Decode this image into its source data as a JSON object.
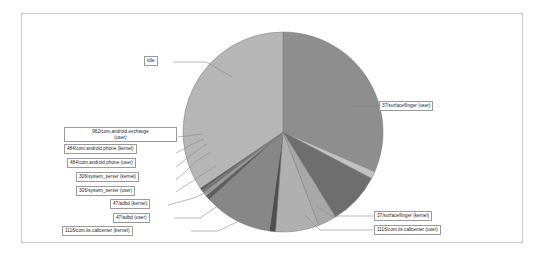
{
  "frame": {
    "border_color": "#c8c8c8",
    "background": "#ffffff"
  },
  "chart_data": {
    "type": "pie",
    "title": "",
    "xlabel": "",
    "ylabel": "",
    "legend_position": "callout-labels",
    "grid": false,
    "center": {
      "x": 283,
      "y": 132
    },
    "radius": 100,
    "start_angle_deg": -90,
    "direction": "clockwise",
    "categories": [
      "37/surfaceflinger (user)",
      "37/surfaceflinger (kernel)",
      "1116/com.iis.callcenter (user)",
      "1116/com.iis.callcenter (kernel)",
      "47/adbd (user)",
      "47/adbd (kernel)",
      "306/system_server (user)",
      "306/system_server (kernel)",
      "484/com.android.phone (user)",
      "484/com.android.phone (kernel)",
      "962/com.android.exchange (user)",
      "Idle"
    ],
    "values": [
      31.5,
      1.2,
      8.5,
      3.0,
      7.0,
      1.0,
      11.0,
      0.8,
      0.6,
      0.5,
      0.4,
      34.5
    ],
    "colors": [
      "#8e8e8e",
      "#c2c2c2",
      "#6e6e6e",
      "#a8a8a8",
      "#b0b0b0",
      "#4e4e4e",
      "#878787",
      "#5f5f5f",
      "#9c9c9c",
      "#747474",
      "#5a5a5a",
      "#b6b6b6"
    ],
    "slice_edge_color": "#7a7a7a"
  },
  "labels": {
    "idle": "Idle",
    "surfaceflinger_user": "37/surfaceflinger (user)",
    "surfaceflinger_kernel": "37/surfaceflinger (kernel)",
    "callcenter_user": "1116/com.iis.callcenter (user)",
    "callcenter_kernel": "1116/com.iis.callcenter (kernel)",
    "adbd_user": "47/adbd (user)",
    "adbd_kernel": "47/adbd (kernel)",
    "system_server_user": "306/system_server (user)",
    "system_server_kernel": "306/system_server (kernel)",
    "phone_user": "484/com.android.phone (user)",
    "phone_kernel": "484/com.android.phone (kernel)",
    "exchange_user_line1": "962/com.android.exchange",
    "exchange_user_line2": "(user)"
  }
}
